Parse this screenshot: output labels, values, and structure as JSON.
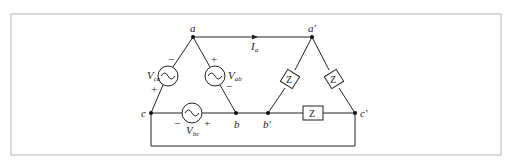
{
  "diagram": {
    "type": "three-phase delta-delta circuit",
    "frame_color": "#b5b5b5",
    "wire_color": "#222222",
    "nodes": {
      "a": "a",
      "b": "b",
      "c": "c",
      "a_prime": "a′",
      "b_prime": "b′",
      "c_prime": "c′"
    },
    "sources": {
      "ca": {
        "label": "V",
        "sub": "ca",
        "plus": "+",
        "minus": "−"
      },
      "ab": {
        "label": "V",
        "sub": "ab",
        "plus": "+",
        "minus": "−"
      },
      "bc": {
        "label": "V",
        "sub": "bc",
        "plus": "+",
        "minus": "−"
      }
    },
    "current": {
      "label": "I",
      "sub": "a"
    },
    "impedances": {
      "a_b": "Z",
      "a_c": "Z",
      "b_c": "Z"
    }
  }
}
